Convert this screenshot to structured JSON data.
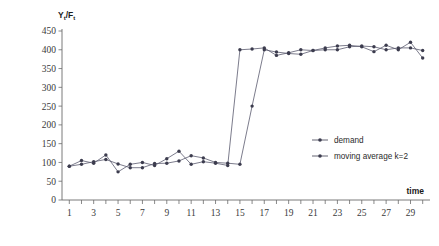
{
  "chart_data": {
    "type": "line",
    "title": "",
    "ylabel": "Yt/Ft",
    "ylabel_main": "Y",
    "ylabel_sub1": "t",
    "ylabel_mid": "/F",
    "ylabel_sub2": "t",
    "xlabel": "time",
    "xlim": [
      0.4,
      30.6
    ],
    "ylim": [
      0,
      450
    ],
    "grid": false,
    "legend_position": "right-middle",
    "y_ticks": [
      0,
      50,
      100,
      150,
      200,
      250,
      300,
      350,
      400,
      450
    ],
    "y_tick_labels": [
      "0",
      "50",
      "100",
      "150",
      "200",
      "250",
      "300",
      "350",
      "400",
      "450"
    ],
    "x_ticks": [
      1,
      2,
      3,
      4,
      5,
      6,
      7,
      8,
      9,
      10,
      11,
      12,
      13,
      14,
      15,
      16,
      17,
      18,
      19,
      20,
      21,
      22,
      23,
      24,
      25,
      26,
      27,
      28,
      29,
      30
    ],
    "x_tick_labels": [
      "1",
      "",
      "3",
      "",
      "5",
      "",
      "7",
      "",
      "9",
      "",
      "11",
      "",
      "13",
      "",
      "15",
      "",
      "17",
      "",
      "19",
      "",
      "21",
      "",
      "23",
      "",
      "25",
      "",
      "27",
      "",
      "29",
      ""
    ],
    "x": [
      1,
      2,
      3,
      4,
      5,
      6,
      7,
      8,
      9,
      10,
      11,
      12,
      13,
      14,
      15,
      16,
      17,
      18,
      19,
      20,
      21,
      22,
      23,
      24,
      25,
      26,
      27,
      28,
      29,
      30
    ],
    "series": [
      {
        "name": "demand",
        "color": "#3c3c4e",
        "marker": "circle",
        "values": [
          90,
          105,
          98,
          120,
          75,
          95,
          100,
          92,
          110,
          130,
          95,
          102,
          98,
          92,
          400,
          402,
          405,
          385,
          392,
          400,
          398,
          405,
          410,
          412,
          408,
          395,
          412,
          400,
          420,
          378
        ]
      },
      {
        "name": "moving average k=2",
        "color": "#3c3c4e",
        "marker": "circle",
        "values": [
          90,
          95,
          102,
          108,
          96,
          86,
          86,
          97,
          98,
          104,
          118,
          112,
          100,
          98,
          95,
          250,
          400,
          394,
          390,
          388,
          398,
          400,
          400,
          408,
          410,
          408,
          400,
          405,
          405,
          398
        ]
      }
    ]
  },
  "legend": {
    "items": [
      {
        "label": "demand"
      },
      {
        "label": "moving average k=2"
      }
    ]
  },
  "axis": {
    "x_title": "time"
  }
}
